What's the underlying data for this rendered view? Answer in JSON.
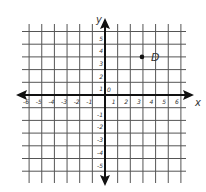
{
  "graph": {
    "title": "",
    "x_axis_label": "x",
    "y_axis_label": "y",
    "origin_label": "0",
    "x_ticks": [
      "-6",
      "-5",
      "-4",
      "-3",
      "-2",
      "-1",
      "1",
      "2",
      "3",
      "4",
      "5",
      "6"
    ],
    "y_ticks": [
      "5",
      "4",
      "3",
      "2",
      "1",
      "-1",
      "-2",
      "-3",
      "-4",
      "-5"
    ],
    "point": {
      "label": "D",
      "x": 3,
      "y": 3
    }
  },
  "chart_data": {
    "type": "scatter",
    "title": "",
    "xlabel": "x",
    "ylabel": "y",
    "xlim": [
      -6,
      6
    ],
    "ylim": [
      -6,
      5
    ],
    "grid": true,
    "series": [
      {
        "name": "D",
        "x": [
          3
        ],
        "y": [
          3
        ]
      }
    ]
  },
  "colors": {
    "grid": "#555555",
    "axis": "#111111",
    "point": "#111111"
  }
}
